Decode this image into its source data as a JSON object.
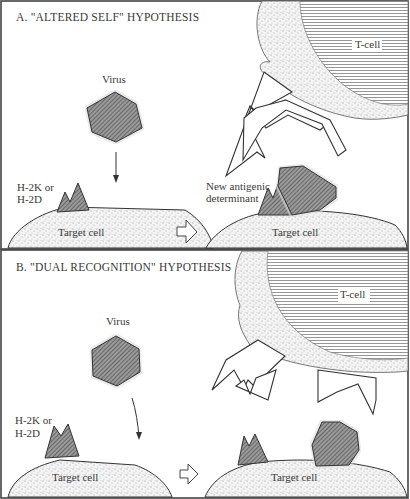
{
  "panels": [
    {
      "id": "A",
      "title": "A. \"ALTERED SELF\" HYPOTHESIS",
      "virus_label": "Virus",
      "mhc_label_line1": "H-2K or",
      "mhc_label_line2": "H-2D",
      "new_det_line1": "New antigenic",
      "new_det_line2": "determinant",
      "target_left": "Target cell",
      "target_right": "Target cell",
      "tcell_label": "T-cell"
    },
    {
      "id": "B",
      "title": "B. \"DUAL RECOGNITION\" HYPOTHESIS",
      "virus_label": "Virus",
      "mhc_label_line1": "H-2K or",
      "mhc_label_line2": "H-2D",
      "target_left": "Target cell",
      "target_right": "Target cell",
      "tcell_label": "T-cell"
    }
  ],
  "colors": {
    "frame": "#444444",
    "stipple": "#dcdcdc",
    "hatch": "#555555",
    "tcell_lines": "#888888"
  }
}
